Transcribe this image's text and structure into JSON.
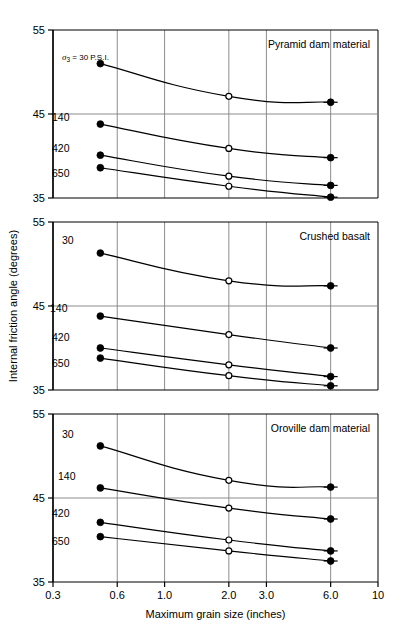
{
  "chart_data": {
    "type": "line",
    "title": "",
    "xlabel": "Maximum grain size (inches)",
    "ylabel": "Internal friction angle (degrees)",
    "xscale": "log",
    "xlim": [
      0.3,
      10
    ],
    "ylim": [
      35,
      55
    ],
    "xticks": [
      "0.3",
      "0.6",
      "1.0",
      "2.0",
      "3.0",
      "6.0",
      "10"
    ],
    "xtick_values": [
      0.3,
      0.6,
      1.0,
      2.0,
      3.0,
      6.0,
      10
    ],
    "yticks": [
      "35",
      "45",
      "55"
    ],
    "ytick_values": [
      35,
      45,
      55
    ],
    "grid": true,
    "legend_position": "inline-labels",
    "series_units": "P.S.I.",
    "sigma_annotation": {
      "symbol": "σ",
      "subscript": "3",
      "text": "= 30 P.S.I."
    },
    "marker_legend": {
      "filled": "measured endpoint",
      "open": "interpolated point"
    },
    "panels": [
      {
        "name": "Pyramid dam material",
        "title": "Pyramid dam material",
        "series": [
          {
            "name": "30",
            "label": "σ3 = 30 P.S.I.",
            "confining_pressure_psi": 30,
            "x": [
              0.5,
              2.0,
              6.0
            ],
            "y": [
              51.0,
              47.1,
              46.4
            ],
            "markers": [
              "filled",
              "open",
              "filled"
            ]
          },
          {
            "name": "140",
            "label": "140",
            "confining_pressure_psi": 140,
            "x": [
              0.5,
              2.0,
              6.0
            ],
            "y": [
              43.8,
              40.9,
              39.8
            ],
            "markers": [
              "filled",
              "open",
              "filled"
            ]
          },
          {
            "name": "420",
            "label": "420",
            "confining_pressure_psi": 420,
            "x": [
              0.5,
              2.0,
              6.0
            ],
            "y": [
              40.1,
              37.6,
              36.5
            ],
            "markers": [
              "filled",
              "open",
              "filled"
            ]
          },
          {
            "name": "650",
            "label": "650",
            "confining_pressure_psi": 650,
            "x": [
              0.5,
              2.0,
              6.0
            ],
            "y": [
              38.6,
              36.4,
              35.1
            ],
            "markers": [
              "filled",
              "open",
              "filled"
            ]
          }
        ]
      },
      {
        "name": "Crushed basalt",
        "title": "Crushed basalt",
        "series": [
          {
            "name": "30",
            "label": "30",
            "confining_pressure_psi": 30,
            "x": [
              0.5,
              2.0,
              6.0
            ],
            "y": [
              51.3,
              48.0,
              47.4
            ],
            "markers": [
              "filled",
              "open",
              "filled"
            ]
          },
          {
            "name": "140",
            "label": "140",
            "confining_pressure_psi": 140,
            "x": [
              0.5,
              2.0,
              6.0
            ],
            "y": [
              43.8,
              41.6,
              40.0
            ],
            "markers": [
              "filled",
              "open",
              "filled"
            ]
          },
          {
            "name": "420",
            "label": "420",
            "confining_pressure_psi": 420,
            "x": [
              0.5,
              2.0,
              6.0
            ],
            "y": [
              40.0,
              38.0,
              36.6
            ],
            "markers": [
              "filled",
              "open",
              "filled"
            ]
          },
          {
            "name": "650",
            "label": "650",
            "confining_pressure_psi": 650,
            "x": [
              0.5,
              2.0,
              6.0
            ],
            "y": [
              38.8,
              36.7,
              35.5
            ],
            "markers": [
              "filled",
              "open",
              "filled"
            ]
          }
        ]
      },
      {
        "name": "Oroville dam material",
        "title": "Oroville dam material",
        "series": [
          {
            "name": "30",
            "label": "30",
            "confining_pressure_psi": 30,
            "x": [
              0.5,
              2.0,
              6.0
            ],
            "y": [
              51.2,
              47.1,
              46.3
            ],
            "markers": [
              "filled",
              "open",
              "filled"
            ]
          },
          {
            "name": "140",
            "label": "140",
            "confining_pressure_psi": 140,
            "x": [
              0.5,
              2.0,
              6.0
            ],
            "y": [
              46.2,
              43.8,
              42.5
            ],
            "markers": [
              "filled",
              "open",
              "filled"
            ]
          },
          {
            "name": "420",
            "label": "420",
            "confining_pressure_psi": 420,
            "x": [
              0.5,
              2.0,
              6.0
            ],
            "y": [
              42.1,
              40.0,
              38.7
            ],
            "markers": [
              "filled",
              "open",
              "filled"
            ]
          },
          {
            "name": "650",
            "label": "650",
            "confining_pressure_psi": 650,
            "x": [
              0.5,
              2.0,
              6.0
            ],
            "y": [
              40.4,
              38.7,
              37.5
            ],
            "markers": [
              "filled",
              "open",
              "filled"
            ]
          }
        ]
      }
    ],
    "colors": {
      "axis": "#000000",
      "grid": "#808080",
      "line": "#000000",
      "marker_fill": "#000000",
      "marker_open_fill": "#ffffff",
      "background": "#ffffff"
    }
  }
}
